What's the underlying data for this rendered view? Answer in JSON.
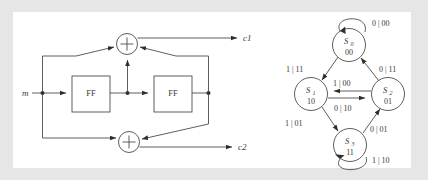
{
  "figure": {
    "background_color": "#e6e6e6",
    "panel_color": "#ffffff",
    "line_color": "#4c4c4c"
  },
  "circuit": {
    "input_label": "m",
    "registers": [
      {
        "label": "FF"
      },
      {
        "label": "FF"
      }
    ],
    "adders": [
      {
        "symbol": "+"
      },
      {
        "symbol": "+"
      }
    ],
    "outputs": [
      {
        "label": "c1"
      },
      {
        "label": "c2"
      }
    ]
  },
  "state_diagram": {
    "states": [
      {
        "name": "S",
        "index": "0",
        "bits": "00"
      },
      {
        "name": "S",
        "index": "1",
        "bits": "10"
      },
      {
        "name": "S",
        "index": "2",
        "bits": "01"
      },
      {
        "name": "S",
        "index": "3",
        "bits": "11"
      }
    ],
    "transitions": [
      {
        "from": "S0",
        "to": "S0",
        "label": "0 | 00"
      },
      {
        "from": "S0",
        "to": "S1",
        "label": "1 | 11"
      },
      {
        "from": "S2",
        "to": "S0",
        "label": "0 | 11"
      },
      {
        "from": "S2",
        "to": "S1",
        "label": "1 | 00"
      },
      {
        "from": "S1",
        "to": "S2",
        "label": "0 | 10"
      },
      {
        "from": "S1",
        "to": "S3",
        "label": "1 | 01"
      },
      {
        "from": "S3",
        "to": "S2",
        "label": "0 | 01"
      },
      {
        "from": "S3",
        "to": "S3",
        "label": "1 | 10"
      }
    ]
  }
}
